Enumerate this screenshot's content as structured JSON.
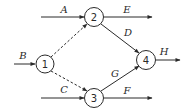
{
  "diagram": {
    "type": "network/activity-on-arrow graph",
    "nodes": [
      {
        "id": "1",
        "label": "1",
        "cx": 45,
        "cy": 64
      },
      {
        "id": "2",
        "label": "2",
        "cx": 94,
        "cy": 17
      },
      {
        "id": "3",
        "label": "3",
        "cx": 94,
        "cy": 98
      },
      {
        "id": "4",
        "label": "4",
        "cx": 146,
        "cy": 60
      }
    ],
    "edges": [
      {
        "id": "A",
        "label": "A",
        "from": null,
        "to": "2",
        "style": "solid"
      },
      {
        "id": "B",
        "label": "B",
        "from": null,
        "to": "1",
        "style": "solid"
      },
      {
        "id": "C",
        "label": "C",
        "from": null,
        "to": "3",
        "style": "solid"
      },
      {
        "id": "D",
        "label": "D",
        "from": "2",
        "to": "4",
        "style": "solid"
      },
      {
        "id": "E",
        "label": "E",
        "from": "2",
        "to": null,
        "style": "solid"
      },
      {
        "id": "F",
        "label": "F",
        "from": "3",
        "to": null,
        "style": "solid"
      },
      {
        "id": "G",
        "label": "G",
        "from": "3",
        "to": "4",
        "style": "solid"
      },
      {
        "id": "H",
        "label": "H",
        "from": "4",
        "to": null,
        "style": "solid"
      },
      {
        "id": "dummy-1-2",
        "label": "",
        "from": "1",
        "to": "2",
        "style": "dashed"
      },
      {
        "id": "dummy-1-3",
        "label": "",
        "from": "1",
        "to": "3",
        "style": "dashed"
      }
    ],
    "colors": {
      "stroke": "#2a2a2a",
      "background": "#ffffff"
    }
  }
}
